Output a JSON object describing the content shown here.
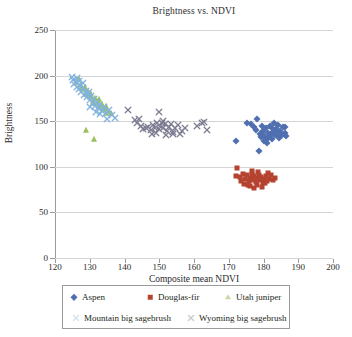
{
  "chart_data": {
    "type": "scatter",
    "title": "Brightness vs. NDVI",
    "xlabel": "Composite mean NDVI",
    "ylabel": "Brightness",
    "xlim": [
      120,
      200
    ],
    "ylim": [
      0,
      250
    ],
    "xticks": [
      120,
      130,
      140,
      150,
      160,
      170,
      180,
      190,
      200
    ],
    "yticks": [
      0,
      50,
      100,
      150,
      200,
      250
    ],
    "grid": "horizontal",
    "legend_position": "bottom",
    "series": [
      {
        "name": "Aspen",
        "marker": "diamond",
        "color": "#4f6fb0",
        "points": [
          [
            172.2,
            128.5
          ],
          [
            175.3,
            148.0
          ],
          [
            177.4,
            143.5
          ],
          [
            178.2,
            152.0
          ],
          [
            178.9,
            136.0
          ],
          [
            179.3,
            132.5
          ],
          [
            179.8,
            139.0
          ],
          [
            180.2,
            134.0
          ],
          [
            180.6,
            142.0
          ],
          [
            180.9,
            130.5
          ],
          [
            181.2,
            137.0
          ],
          [
            181.5,
            133.0
          ],
          [
            181.8,
            145.0
          ],
          [
            182.1,
            135.5
          ],
          [
            182.4,
            131.0
          ],
          [
            182.8,
            138.5
          ],
          [
            183.2,
            134.5
          ],
          [
            183.6,
            141.0
          ],
          [
            184.0,
            136.5
          ],
          [
            184.4,
            132.0
          ],
          [
            184.8,
            139.5
          ],
          [
            185.2,
            135.0
          ],
          [
            185.6,
            143.5
          ],
          [
            186.1,
            137.5
          ],
          [
            186.6,
            134.0
          ],
          [
            178.6,
            117.5
          ],
          [
            176.5,
            146.5
          ],
          [
            183.0,
            148.5
          ],
          [
            186.3,
            144.0
          ],
          [
            180.0,
            128.0
          ],
          [
            181.0,
            126.5
          ],
          [
            177.8,
            140.5
          ],
          [
            184.2,
            145.5
          ],
          [
            182.5,
            142.5
          ],
          [
            179.5,
            144.5
          ]
        ]
      },
      {
        "name": "Douglas-fir",
        "marker": "square",
        "color": "#b5432f",
        "points": [
          [
            172.3,
            98.5
          ],
          [
            172.0,
            90.0
          ],
          [
            173.2,
            88.5
          ],
          [
            174.0,
            92.0
          ],
          [
            174.6,
            86.5
          ],
          [
            175.2,
            90.5
          ],
          [
            175.8,
            84.5
          ],
          [
            176.2,
            88.0
          ],
          [
            176.6,
            92.5
          ],
          [
            177.0,
            86.0
          ],
          [
            177.4,
            89.5
          ],
          [
            177.8,
            83.5
          ],
          [
            178.2,
            87.5
          ],
          [
            178.6,
            91.0
          ],
          [
            179.0,
            85.0
          ],
          [
            179.4,
            88.5
          ],
          [
            179.8,
            82.5
          ],
          [
            180.2,
            86.5
          ],
          [
            180.7,
            90.0
          ],
          [
            181.2,
            93.5
          ],
          [
            181.7,
            87.0
          ],
          [
            182.2,
            91.5
          ],
          [
            182.7,
            85.5
          ],
          [
            183.2,
            88.0
          ],
          [
            176.0,
            78.5
          ],
          [
            177.2,
            76.5
          ],
          [
            178.0,
            80.0
          ],
          [
            175.5,
            80.5
          ],
          [
            174.4,
            81.5
          ],
          [
            179.6,
            78.0
          ],
          [
            180.5,
            82.0
          ],
          [
            176.8,
            95.5
          ],
          [
            178.4,
            94.5
          ],
          [
            173.6,
            84.0
          ],
          [
            181.0,
            84.5
          ]
        ]
      },
      {
        "name": "Utah juniper",
        "marker": "triangle",
        "color": "#9cc05d",
        "points": [
          [
            126.1,
            193.5
          ],
          [
            126.8,
            196.0
          ],
          [
            127.4,
            190.0
          ],
          [
            128.2,
            185.0
          ],
          [
            128.9,
            180.0
          ],
          [
            129.4,
            183.5
          ],
          [
            130.0,
            176.5
          ],
          [
            130.5,
            179.5
          ],
          [
            131.0,
            172.5
          ],
          [
            131.5,
            175.0
          ],
          [
            132.0,
            169.5
          ],
          [
            132.5,
            172.0
          ],
          [
            133.0,
            166.5
          ],
          [
            133.5,
            169.0
          ],
          [
            134.0,
            164.0
          ],
          [
            134.6,
            167.0
          ],
          [
            135.2,
            161.5
          ],
          [
            136.0,
            159.5
          ],
          [
            129.0,
            140.5
          ],
          [
            131.3,
            130.0
          ],
          [
            130.8,
            170.0
          ],
          [
            132.8,
            174.0
          ],
          [
            128.5,
            188.0
          ],
          [
            133.8,
            163.0
          ],
          [
            127.9,
            186.5
          ],
          [
            134.8,
            158.5
          ]
        ]
      },
      {
        "name": "Mountain big sagebrush",
        "marker": "x",
        "color": "#7fb3dd",
        "points": [
          [
            124.8,
            199.0
          ],
          [
            125.2,
            195.5
          ],
          [
            125.6,
            191.0
          ],
          [
            126.0,
            193.0
          ],
          [
            126.4,
            188.0
          ],
          [
            126.8,
            185.5
          ],
          [
            127.2,
            190.0
          ],
          [
            127.6,
            182.5
          ],
          [
            128.0,
            186.0
          ],
          [
            128.4,
            179.0
          ],
          [
            128.8,
            183.0
          ],
          [
            129.2,
            176.0
          ],
          [
            129.6,
            180.0
          ],
          [
            130.0,
            173.0
          ],
          [
            130.4,
            177.5
          ],
          [
            130.8,
            170.0
          ],
          [
            131.2,
            174.0
          ],
          [
            131.6,
            167.0
          ],
          [
            132.0,
            171.5
          ],
          [
            132.4,
            164.0
          ],
          [
            132.8,
            168.0
          ],
          [
            133.4,
            161.5
          ],
          [
            134.0,
            165.5
          ],
          [
            134.8,
            159.0
          ],
          [
            135.6,
            162.0
          ],
          [
            136.4,
            156.5
          ],
          [
            137.2,
            153.5
          ],
          [
            126.2,
            197.0
          ],
          [
            127.0,
            194.0
          ],
          [
            129.9,
            182.0
          ],
          [
            133.0,
            158.0
          ],
          [
            131.8,
            160.5
          ],
          [
            135.0,
            152.5
          ],
          [
            130.2,
            166.0
          ],
          [
            128.2,
            192.0
          ]
        ]
      },
      {
        "name": "Wyoming big sagebrush",
        "marker": "x",
        "color": "#7d7d93",
        "points": [
          [
            141.0,
            162.5
          ],
          [
            143.0,
            151.0
          ],
          [
            143.6,
            148.5
          ],
          [
            144.2,
            152.5
          ],
          [
            146.3,
            142.0
          ],
          [
            146.9,
            144.0
          ],
          [
            147.5,
            140.5
          ],
          [
            148.2,
            146.0
          ],
          [
            148.8,
            143.0
          ],
          [
            149.3,
            147.5
          ],
          [
            149.8,
            141.0
          ],
          [
            150.3,
            145.0
          ],
          [
            150.0,
            160.0
          ],
          [
            150.8,
            148.5
          ],
          [
            151.2,
            142.5
          ],
          [
            151.7,
            146.5
          ],
          [
            152.2,
            139.5
          ],
          [
            152.7,
            143.5
          ],
          [
            153.3,
            147.0
          ],
          [
            153.9,
            138.5
          ],
          [
            154.6,
            142.0
          ],
          [
            155.3,
            145.5
          ],
          [
            155.9,
            135.5
          ],
          [
            156.6,
            139.0
          ],
          [
            161.0,
            144.5
          ],
          [
            162.4,
            148.5
          ],
          [
            163.6,
            140.0
          ],
          [
            163.0,
            149.0
          ],
          [
            144.8,
            144.5
          ],
          [
            145.4,
            141.5
          ],
          [
            147.9,
            136.5
          ],
          [
            152.0,
            135.0
          ],
          [
            154.0,
            136.0
          ],
          [
            151.0,
            150.5
          ],
          [
            149.0,
            137.0
          ],
          [
            157.4,
            143.0
          ]
        ]
      }
    ]
  },
  "legend": {
    "row1": [
      {
        "label": "Aspen",
        "marker": "diamond",
        "color": "#4f6fb0"
      },
      {
        "label": "Douglas-fir",
        "marker": "square",
        "color": "#b5432f"
      },
      {
        "label": "Utah juniper",
        "marker": "triangle",
        "color": "#c6d9a0"
      }
    ],
    "row2": [
      {
        "label": "Mountain big sagebrush",
        "marker": "x",
        "color": "#cfe3f2"
      },
      {
        "label": "Wyoming big sagebrush",
        "marker": "x",
        "color": "#c9c9d2"
      }
    ]
  }
}
